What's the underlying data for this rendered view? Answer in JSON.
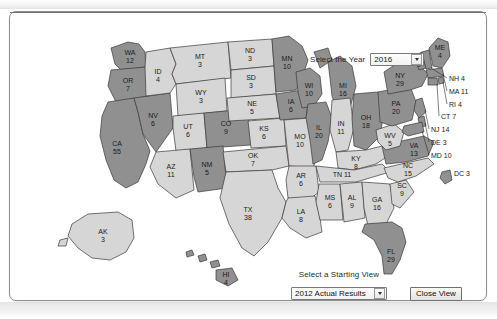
{
  "window": {
    "title": "Electoral College Interactive Map"
  },
  "controls": {
    "year": {
      "label": "Select the Year",
      "value": "2016",
      "options": [
        "2016"
      ]
    },
    "starting_view": {
      "label": "Select a Starting View",
      "value": "2012 Actual Results",
      "options": [
        "2012 Actual Results"
      ]
    },
    "close_button": {
      "label": "Close View"
    }
  },
  "map": {
    "title": "United States Electoral College Map",
    "colors": {
      "democrat": "#8f8f8f",
      "republican": "#d4d4d4",
      "border": "#3a3a3a",
      "label": "#1b1b1b"
    },
    "states": [
      {
        "code": "WA",
        "votes": "12",
        "label": "WA\n12",
        "party": "democrat"
      },
      {
        "code": "OR",
        "votes": "7",
        "label": "OR\n7",
        "party": "democrat"
      },
      {
        "code": "CA",
        "votes": "55",
        "label": "CA\n55",
        "party": "democrat"
      },
      {
        "code": "NV",
        "votes": "6",
        "label": "NV\n6",
        "party": "democrat"
      },
      {
        "code": "ID",
        "votes": "4",
        "label": "ID\n4",
        "party": "republican"
      },
      {
        "code": "MT",
        "votes": "3",
        "label": "MT\n3",
        "party": "republican"
      },
      {
        "code": "WY",
        "votes": "3",
        "label": "WY\n3",
        "party": "republican"
      },
      {
        "code": "UT",
        "votes": "6",
        "label": "UT\n6",
        "party": "republican"
      },
      {
        "code": "AZ",
        "votes": "11",
        "label": "AZ\n11",
        "party": "republican"
      },
      {
        "code": "CO",
        "votes": "9",
        "label": "CO\n9",
        "party": "democrat"
      },
      {
        "code": "NM",
        "votes": "5",
        "label": "NM\n5",
        "party": "democrat"
      },
      {
        "code": "ND",
        "votes": "3",
        "label": "ND\n3",
        "party": "republican"
      },
      {
        "code": "SD",
        "votes": "3",
        "label": "SD\n3",
        "party": "republican"
      },
      {
        "code": "NE",
        "votes": "5",
        "label": "NE\n5",
        "party": "republican"
      },
      {
        "code": "KS",
        "votes": "6",
        "label": "KS\n6",
        "party": "republican"
      },
      {
        "code": "OK",
        "votes": "7",
        "label": "OK\n7",
        "party": "republican"
      },
      {
        "code": "TX",
        "votes": "38",
        "label": "TX\n38",
        "party": "republican"
      },
      {
        "code": "MN",
        "votes": "10",
        "label": "MN\n10",
        "party": "democrat"
      },
      {
        "code": "IA",
        "votes": "6",
        "label": "IA\n6",
        "party": "democrat"
      },
      {
        "code": "MO",
        "votes": "10",
        "label": "MO\n10",
        "party": "republican"
      },
      {
        "code": "AR",
        "votes": "6",
        "label": "AR\n6",
        "party": "republican"
      },
      {
        "code": "LA",
        "votes": "8",
        "label": "LA\n8",
        "party": "republican"
      },
      {
        "code": "WI",
        "votes": "10",
        "label": "WI\n10",
        "party": "democrat"
      },
      {
        "code": "IL",
        "votes": "20",
        "label": "IL\n20",
        "party": "democrat"
      },
      {
        "code": "MI",
        "votes": "16",
        "label": "MI\n16",
        "party": "democrat"
      },
      {
        "code": "IN",
        "votes": "11",
        "label": "IN\n11",
        "party": "republican"
      },
      {
        "code": "OH",
        "votes": "18",
        "label": "OH\n18",
        "party": "democrat"
      },
      {
        "code": "KY",
        "votes": "8",
        "label": "KY\n8",
        "party": "republican"
      },
      {
        "code": "TN",
        "votes": "11",
        "label": "TN 11",
        "party": "republican"
      },
      {
        "code": "MS",
        "votes": "6",
        "label": "MS\n6",
        "party": "republican"
      },
      {
        "code": "AL",
        "votes": "9",
        "label": "AL\n9",
        "party": "republican"
      },
      {
        "code": "GA",
        "votes": "16",
        "label": "GA\n16",
        "party": "republican"
      },
      {
        "code": "FL",
        "votes": "29",
        "label": "FL\n29",
        "party": "democrat"
      },
      {
        "code": "SC",
        "votes": "9",
        "label": "SC\n9",
        "party": "republican"
      },
      {
        "code": "NC",
        "votes": "15",
        "label": "NC\n15",
        "party": "republican"
      },
      {
        "code": "VA",
        "votes": "13",
        "label": "VA\n13",
        "party": "democrat"
      },
      {
        "code": "WV",
        "votes": "5",
        "label": "WV\n5",
        "party": "republican"
      },
      {
        "code": "PA",
        "votes": "20",
        "label": "PA\n20",
        "party": "democrat"
      },
      {
        "code": "NY",
        "votes": "29",
        "label": "NY\n29",
        "party": "democrat"
      },
      {
        "code": "VT",
        "votes": "3",
        "label": "VT\n3",
        "party": "democrat"
      },
      {
        "code": "ME",
        "votes": "4",
        "label": "ME\n4",
        "party": "democrat"
      },
      {
        "code": "AK",
        "votes": "3",
        "label": "AK\n3",
        "party": "republican"
      },
      {
        "code": "HI",
        "votes": "4",
        "label": "HI\n4",
        "party": "democrat"
      }
    ],
    "callouts": [
      {
        "code": "NH",
        "votes": "4",
        "label": "NH 4"
      },
      {
        "code": "MA",
        "votes": "11",
        "label": "MA 11"
      },
      {
        "code": "RI",
        "votes": "4",
        "label": "RI 4"
      },
      {
        "code": "CT",
        "votes": "7",
        "label": "CT 7"
      },
      {
        "code": "NJ",
        "votes": "14",
        "label": "NJ 14"
      },
      {
        "code": "DE",
        "votes": "3",
        "label": "DE 3"
      },
      {
        "code": "MD",
        "votes": "10",
        "label": "MD 10"
      },
      {
        "code": "DC",
        "votes": "3",
        "label": "DC 3"
      }
    ],
    "state_label_text": {
      "WA_a": "WA",
      "WA_b": "12",
      "OR_a": "OR",
      "OR_b": "7",
      "CA_a": "CA",
      "CA_b": "55",
      "NV_a": "NV",
      "NV_b": "6",
      "ID_a": "ID",
      "ID_b": "4",
      "MT_a": "MT",
      "MT_b": "3",
      "WY_a": "WY",
      "WY_b": "3",
      "UT_a": "UT",
      "UT_b": "6",
      "AZ_a": "AZ",
      "AZ_b": "11",
      "CO_a": "CO",
      "CO_b": "9",
      "NM_a": "NM",
      "NM_b": "5",
      "ND_a": "ND",
      "ND_b": "3",
      "SD_a": "SD",
      "SD_b": "3",
      "NE_a": "NE",
      "NE_b": "5",
      "KS_a": "KS",
      "KS_b": "6",
      "OK_a": "OK",
      "OK_b": "7",
      "TX_a": "TX",
      "TX_b": "38",
      "MN_a": "MN",
      "MN_b": "10",
      "IA_a": "IA",
      "IA_b": "6",
      "MO_a": "MO",
      "MO_b": "10",
      "AR_a": "AR",
      "AR_b": "6",
      "LA_a": "LA",
      "LA_b": "8",
      "WI_a": "WI",
      "WI_b": "10",
      "IL_a": "IL",
      "IL_b": "20",
      "MI_a": "MI",
      "MI_b": "16",
      "IN_a": "IN",
      "IN_b": "11",
      "OH_a": "OH",
      "OH_b": "18",
      "KY_a": "KY",
      "KY_b": "8",
      "TN_a": "TN 11",
      "MS_a": "MS",
      "MS_b": "6",
      "AL_a": "AL",
      "AL_b": "9",
      "GA_a": "GA",
      "GA_b": "16",
      "FL_a": "FL",
      "FL_b": "29",
      "SC_a": "SC",
      "SC_b": "9",
      "NC_a": "NC",
      "NC_b": "15",
      "VA_a": "VA",
      "VA_b": "13",
      "WV_a": "WV",
      "WV_b": "5",
      "PA_a": "PA",
      "PA_b": "20",
      "NY_a": "NY",
      "NY_b": "29",
      "VT_a": "VT",
      "VT_b": "3",
      "ME_a": "ME",
      "ME_b": "4",
      "AK_a": "AK",
      "AK_b": "3",
      "HI_a": "HI",
      "HI_b": "4",
      "NH": "NH 4",
      "MA": "MA 11",
      "RI": "RI 4",
      "CT": "CT 7",
      "NJ": "NJ 14",
      "DE": "DE 3",
      "MD": "MD 10",
      "DC": "DC 3"
    }
  }
}
